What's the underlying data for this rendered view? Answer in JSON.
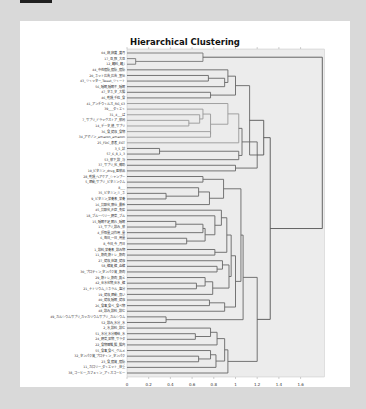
{
  "chart_data": {
    "type": "dendrogram",
    "title": "Hierarchical Clustering",
    "xlabel": "",
    "ylabel": "",
    "orientation": "horizontal",
    "xlim": [
      0,
      1.8
    ],
    "x_ticks": [
      "0",
      "0.2",
      "0.4",
      "0.6",
      "0.8",
      "1",
      "1.2",
      "1.4",
      "1.6"
    ],
    "grid": false,
    "leaves": [
      "04_卵_卵黄_黄月",
      "17_豆_豚_大豆",
      "12_麺料_麺_i",
      "44_中性脂肪_脂肪_脂肪",
      "20_ネット広告_広告_宣伝",
      "43_ツイッター_Tweet_ツイート",
      "56_睡眠_睡眠不_睡眠",
      "47_タネ_タ_大腸",
      "46_乾燥_千粒_食",
      "41_アンチウイルス_RG_63",
      "39___ダイエイ",
      "31_4___ぱ",
      "7_サプリ_ドラッグストア_薬局",
      "14_データ_値_サプリ",
      "36_食_健康_食物",
      "34_アマゾン_amazon_amazon",
      "25_FDC_患者_EGT",
      "3_5_試",
      "57_6_8_1_3",
      "53_薬下_飲_与",
      "37_サプリ_化_補助",
      "10_ビタミン_drug_医薬品",
      "28_乾燥_ヘアケア_シャンプー",
      "5_運動_サプリ_ビタミンクム",
      "8___",
      "35_ビタミン_ミ_ネ",
      "9_ビタミン_栄養素_栄養",
      "16_抗酸化_療仕_最新",
      "45_抗酸化_炎症_免疫",
      "18_ブルーベリー_野菜_ブル",
      "15_睡眠不足_眠れ_睡眠",
      "13_サプリ_飲み_薬",
      "4_摂取量_副作用_量",
      "6_毎日_一日_用量",
      "8_今日_今_月日",
      "1_飲料_栄養素_飲み物",
      "11_筋肉_筋トレ_筋肉",
      "27_健康_体調_健康",
      "58_糖質_糖_血糖",
      "30_プロテイン_タンパク質_筋肉",
      "29_筋トレ_筋肉_鍛え",
      "42_炭水化物_炭水_糖",
      "21_ナトリウム_ミネラル_塩分",
      "19_健康_運動_良い",
      "40_健康_睡眠_健康",
      "26_食事_食べ_食べ物",
      "48_飲み_飲料_飲む",
      "49_カルシウムサプリ_カッカリウムサプリ_カルシウム",
      "52_飲み_水分_水",
      "2_水_飲料_飲む",
      "51_水分_水分補給_水",
      "24_野菜_果物_サラダ",
      "22_食物繊維_腸_腸内",
      "55_食事_食べ_グルメ",
      "32_タンパク質_プロテイン_タンパク",
      "23_食_脂質_脂肪",
      "11_カロリー_ダイエット_体重",
      "38_コーヒー_カフェイン_アイスコーヒー"
    ]
  },
  "page": {
    "title": "Hierarchical Clustering"
  }
}
